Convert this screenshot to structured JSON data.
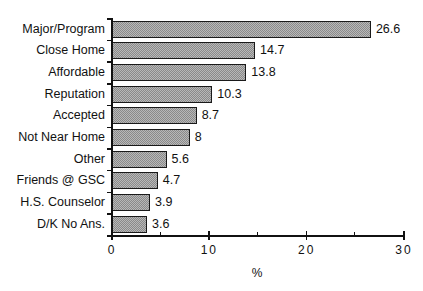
{
  "chart_data": {
    "type": "bar",
    "orientation": "horizontal",
    "title": "",
    "categories": [
      "Major/Program",
      "Close Home",
      "Affordable",
      "Reputation",
      "Accepted",
      "Not Near Home",
      "Other",
      "Friends @ GSC",
      "H.S. Counselor",
      "D/K No Ans."
    ],
    "values": [
      26.6,
      14.7,
      13.8,
      10.3,
      8.7,
      8,
      5.6,
      4.7,
      3.9,
      3.6
    ],
    "value_labels": [
      "26.6",
      "14.7",
      "13.8",
      "10.3",
      "8.7",
      "8",
      "5.6",
      "4.7",
      "3.9",
      "3.6"
    ],
    "xlabel": "%",
    "ylabel": "",
    "xlim": [
      0,
      30
    ],
    "xticks": [
      0,
      10,
      20,
      30
    ],
    "xtick_labels": [
      "0",
      "10",
      "20",
      "30"
    ],
    "minor_xticks": [
      5,
      15,
      25
    ],
    "grid": false,
    "legend": null,
    "bar_fill": "stippled gray pattern",
    "bar_edge_color": "#1a1a1a"
  },
  "layout": {
    "plot_left_px": 111,
    "plot_right_px": 403,
    "plot_top_px": 18,
    "plot_bottom_px": 235,
    "bar_pitch_px": 21.7,
    "bar_height_px": 17
  }
}
